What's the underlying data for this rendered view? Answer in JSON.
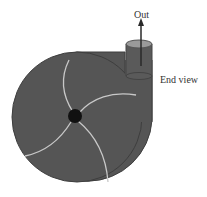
{
  "diagram": {
    "labels": {
      "out": "Out",
      "end_view": "End view"
    },
    "components": {
      "casing": "volute-casing",
      "impeller_blades": 4,
      "hub": "impeller-hub",
      "outlet": "discharge-pipe",
      "flow_arrow": "arrow-up"
    },
    "colors": {
      "casing_fill": "#555555",
      "casing_stroke": "#3a3a3a",
      "blade": "#c8c8c8",
      "hub": "#111111",
      "pipe_top": "#9a9a9a",
      "arrow": "#2a2a2a",
      "background": "#ffffff"
    }
  }
}
